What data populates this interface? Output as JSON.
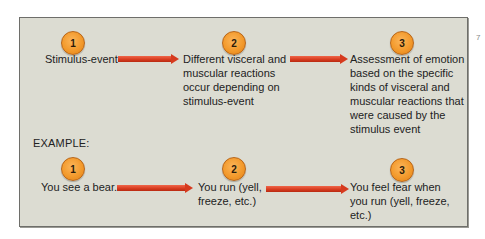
{
  "diagram": {
    "type": "flow",
    "theory_steps": [
      {
        "number": "1",
        "text_lines": [
          "Stimulus-event"
        ]
      },
      {
        "number": "2",
        "text_lines": [
          "Different visceral and",
          "muscular reactions",
          "occur depending on",
          "stimulus-event"
        ]
      },
      {
        "number": "3",
        "text_lines": [
          "Assessment of emotion",
          "based on the specific",
          "kinds of visceral and",
          "muscular reactions that",
          "were caused by the",
          "stimulus event"
        ]
      }
    ],
    "example_label": "EXAMPLE:",
    "example_steps": [
      {
        "number": "1",
        "text_lines": [
          "You see a bear."
        ]
      },
      {
        "number": "2",
        "text_lines": [
          "You run (yell,",
          "freeze, etc.)"
        ]
      },
      {
        "number": "3",
        "text_lines": [
          "You feel fear when",
          "you run (yell, freeze,",
          "etc.)"
        ]
      }
    ],
    "colors": {
      "panel_bg": "#dcdcd2",
      "circle": "#f39a2c",
      "arrow": "#d63a1e",
      "text": "#222222"
    },
    "margin_mark": "7"
  }
}
